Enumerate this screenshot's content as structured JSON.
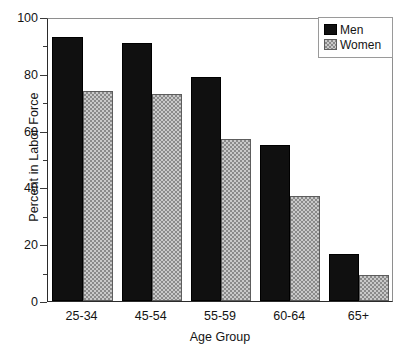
{
  "chart_data": {
    "type": "bar",
    "title": "",
    "subtitle": "",
    "xlabel": "Age Group",
    "ylabel": "Percent in Labor Force",
    "categories": [
      "25-34",
      "45-54",
      "55-59",
      "60-64",
      "65+"
    ],
    "series": [
      {
        "name": "Men",
        "color": "#101010",
        "pattern": "solid",
        "values": [
          93,
          91,
          79,
          55,
          16.5
        ]
      },
      {
        "name": "Women",
        "color": "#c9c9c9",
        "pattern": "checkered",
        "values": [
          74,
          73,
          57,
          37,
          9
        ]
      }
    ],
    "ylim": [
      0,
      100
    ],
    "yticks": [
      0,
      20,
      40,
      60,
      80,
      100
    ],
    "yticks_minor": [
      10,
      30,
      50,
      70,
      90
    ],
    "grid": false,
    "legend_position": "top-right",
    "legend_entries": [
      "Men",
      "Women"
    ],
    "annotations": []
  },
  "axis": {
    "y_title": "Percent in Labor Force",
    "x_title": "Age Group",
    "y_tick_labels": [
      "0",
      "20",
      "40",
      "60",
      "80",
      "100"
    ],
    "x_tick_labels": [
      "25-34",
      "45-54",
      "55-59",
      "60-64",
      "65+"
    ]
  },
  "legend": {
    "items": [
      {
        "label": "Men"
      },
      {
        "label": "Women"
      }
    ]
  }
}
